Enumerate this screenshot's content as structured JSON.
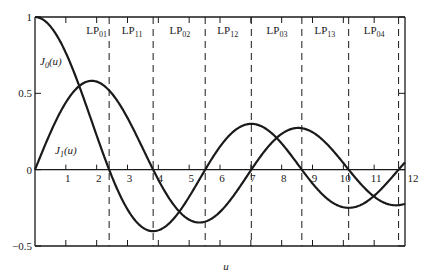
{
  "chart_data": {
    "type": "line",
    "title": "",
    "xlabel": "u",
    "ylabel": "",
    "xlim": [
      0,
      12
    ],
    "ylim": [
      -0.5,
      1
    ],
    "grid": false,
    "legend": "inline labels",
    "x_ticks": [
      1,
      2,
      3,
      4,
      5,
      6,
      7,
      8,
      9,
      10,
      11,
      12
    ],
    "x_tick_labels": [
      "1",
      "2",
      "3",
      "4",
      "5",
      "6",
      "7",
      "8",
      "9",
      "10",
      "11",
      "12"
    ],
    "y_ticks": [
      -0.5,
      0,
      0.5,
      1
    ],
    "y_tick_labels": [
      "−0.5",
      "0",
      "0.5",
      "1"
    ],
    "series": [
      {
        "name": "J0(u)",
        "label_main": "J",
        "label_sub": "0",
        "label_suffix": "(u)",
        "function": "besselJ0",
        "x": [
          0,
          1,
          2,
          2.405,
          3,
          3.832,
          4,
          5,
          5.52,
          6,
          7,
          7.016,
          8,
          8.654,
          9,
          10,
          10.173,
          11,
          11.792,
          12
        ],
        "values": [
          1.0,
          0.765,
          0.224,
          0.0,
          -0.26,
          -0.403,
          -0.397,
          -0.178,
          0.0,
          0.151,
          0.3,
          0.3,
          0.172,
          0.0,
          -0.09,
          -0.246,
          -0.25,
          -0.171,
          0.0,
          0.048
        ]
      },
      {
        "name": "J1(u)",
        "label_main": "J",
        "label_sub": "1",
        "label_suffix": "(u)",
        "function": "besselJ1",
        "x": [
          0,
          1,
          1.841,
          2,
          3,
          3.832,
          4,
          5,
          5.331,
          6,
          7,
          7.016,
          8,
          8.536,
          9,
          10,
          10.173,
          11,
          11.706,
          12
        ],
        "values": [
          0.0,
          0.44,
          0.582,
          0.577,
          0.339,
          0.0,
          -0.066,
          -0.328,
          -0.346,
          -0.277,
          -0.005,
          0.0,
          0.235,
          0.273,
          0.245,
          0.043,
          0.0,
          -0.177,
          -0.232,
          -0.223
        ]
      }
    ],
    "cutoff_lines": [
      2.405,
      3.832,
      5.52,
      7.016,
      8.654,
      10.173,
      11.792
    ],
    "regions": [
      {
        "label": "LP",
        "sub": "01",
        "x": 2.0
      },
      {
        "label": "LP",
        "sub": "11",
        "x": 3.15
      },
      {
        "label": "LP",
        "sub": "02",
        "x": 4.7
      },
      {
        "label": "LP",
        "sub": "12",
        "x": 6.25
      },
      {
        "label": "LP",
        "sub": "03",
        "x": 7.85
      },
      {
        "label": "LP",
        "sub": "13",
        "x": 9.4
      },
      {
        "label": "LP",
        "sub": "04",
        "x": 11.0
      }
    ]
  },
  "colors": {
    "ink": "#1a1a1a",
    "background": "#ffffff"
  },
  "plot_area": {
    "left": 35,
    "right": 405,
    "top": 17,
    "bottom": 246
  }
}
